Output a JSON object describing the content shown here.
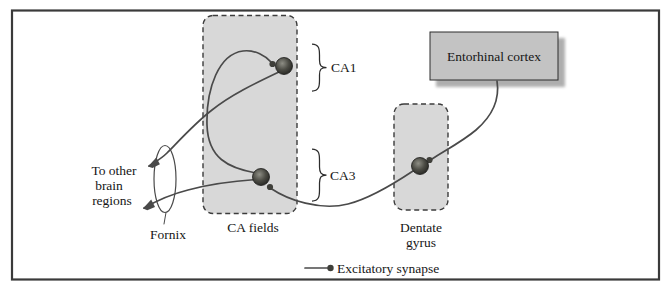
{
  "diagram": {
    "labels": {
      "ca1": "CA1",
      "ca3": "CA3",
      "ca_fields": "CA fields",
      "dentate_line1": "Dentate",
      "dentate_line2": "gyrus",
      "entorhinal": "Entorhinal cortex",
      "fornix": "Fornix",
      "to_other_line1": "To other",
      "to_other_line2": "brain",
      "to_other_line3": "regions"
    },
    "legend": {
      "symbol": "line-with-dot",
      "label": "Excitatory synapse"
    },
    "nodes": [
      {
        "id": "entorhinal-cortex",
        "label": "Entorhinal cortex",
        "type": "solid-box"
      },
      {
        "id": "dentate-gyrus",
        "label": "Dentate gyrus",
        "type": "dashed-region"
      },
      {
        "id": "ca-fields",
        "label": "CA fields",
        "type": "dashed-region",
        "sublabels": [
          "CA1",
          "CA3"
        ]
      },
      {
        "id": "fornix",
        "label": "Fornix",
        "type": "tract-ellipse"
      },
      {
        "id": "other-brain-regions",
        "label": "To other brain regions",
        "type": "external-target"
      }
    ],
    "connections": [
      {
        "from": "Entorhinal cortex",
        "to": "Dentate gyrus",
        "kind": "excitatory synapse"
      },
      {
        "from": "Dentate gyrus",
        "to": "CA3",
        "kind": "excitatory synapse"
      },
      {
        "from": "CA3",
        "to": "CA1",
        "kind": "excitatory synapse"
      },
      {
        "from": "CA1",
        "to": "To other brain regions",
        "via": "Fornix",
        "kind": "arrow"
      },
      {
        "from": "CA3",
        "to": "To other brain regions",
        "via": "Fornix",
        "kind": "arrow"
      }
    ],
    "colors": {
      "region_fill": "#d8d8d8",
      "entorhinal_fill": "#c3c3c3",
      "line": "#4a4a4a",
      "frame": "#3a3a3a",
      "text": "#161616"
    }
  }
}
